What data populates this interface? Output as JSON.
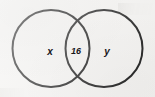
{
  "diagram": {
    "type": "venn-diagram",
    "title": "",
    "background_color": "#f2f1ef",
    "stroke_color": "#1a1a1a",
    "text_color": "#17161a",
    "stroke_width": 2,
    "circles": [
      {
        "id": "left-circle",
        "region_label": "x",
        "center_x": 51,
        "center_y": 48.5,
        "radius": 38.5
      },
      {
        "id": "right-circle",
        "region_label": "y",
        "center_x": 104,
        "center_y": 48.5,
        "radius": 38.5
      }
    ],
    "labels": {
      "left_only": "x",
      "intersection": "16",
      "right_only": "y"
    }
  }
}
